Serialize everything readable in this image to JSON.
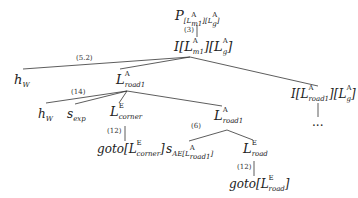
{
  "diagram": {
    "type": "tree",
    "nodes": {
      "root": {
        "base": "P",
        "arg1_sym": "L",
        "arg1_sup": "A",
        "arg1_sub": "m1",
        "arg2_sym": "L",
        "arg2_sup": "A",
        "arg2_sub": "g"
      },
      "i_main": {
        "base": "I",
        "arg1_sym": "L",
        "arg1_sup": "A",
        "arg1_sub": "m1",
        "arg2_sym": "L",
        "arg2_sup": "A",
        "arg2_sub": "g"
      },
      "hw_top": {
        "base": "h",
        "sub": "W"
      },
      "lroad1": {
        "base": "L",
        "sup": "A",
        "sub": "road1"
      },
      "i_road": {
        "base": "I",
        "arg1_sym": "L",
        "arg1_sup": "A",
        "arg1_sub": "road1",
        "arg2_sym": "L",
        "arg2_sup": "A",
        "arg2_sub": "g"
      },
      "hw_low": {
        "base": "h",
        "sub": "W"
      },
      "sexp": {
        "base": "s",
        "sub": "exp"
      },
      "lcorner": {
        "base": "L",
        "sup": "E",
        "sub": "corner"
      },
      "lroad1b": {
        "base": "L",
        "sup": "A",
        "sub": "road1"
      },
      "ellipsis": {
        "text": "..."
      },
      "goto_corner": {
        "base": "goto",
        "arg_sym": "L",
        "arg_sup": "E",
        "arg_sub": "corner"
      },
      "sae": {
        "base": "s",
        "sub": "AE",
        "arg_sym": "L",
        "arg_sup": "A",
        "arg_sub": "road1"
      },
      "lroad": {
        "base": "L",
        "sup": "E",
        "sub": "road"
      },
      "goto_road": {
        "base": "goto",
        "arg_sym": "L",
        "arg_sup": "E",
        "arg_sub": "road"
      }
    },
    "edge_labels": {
      "e3": "(3)",
      "e52": "(5.2)",
      "e14": "(14)",
      "e12a": "(12)",
      "e6": "(6)",
      "e12b": "(12)"
    }
  }
}
